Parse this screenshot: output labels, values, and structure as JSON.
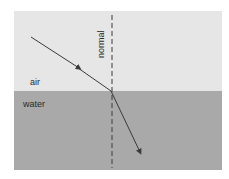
{
  "diagram": {
    "type": "refraction",
    "labels": {
      "upper_medium": "air",
      "lower_medium": "water",
      "normal": "normal"
    },
    "colors": {
      "air": "#e6e6e6",
      "water": "#a9a9a9",
      "ray": "#3a3a3a",
      "normal_line": "#3a3a3a"
    }
  }
}
